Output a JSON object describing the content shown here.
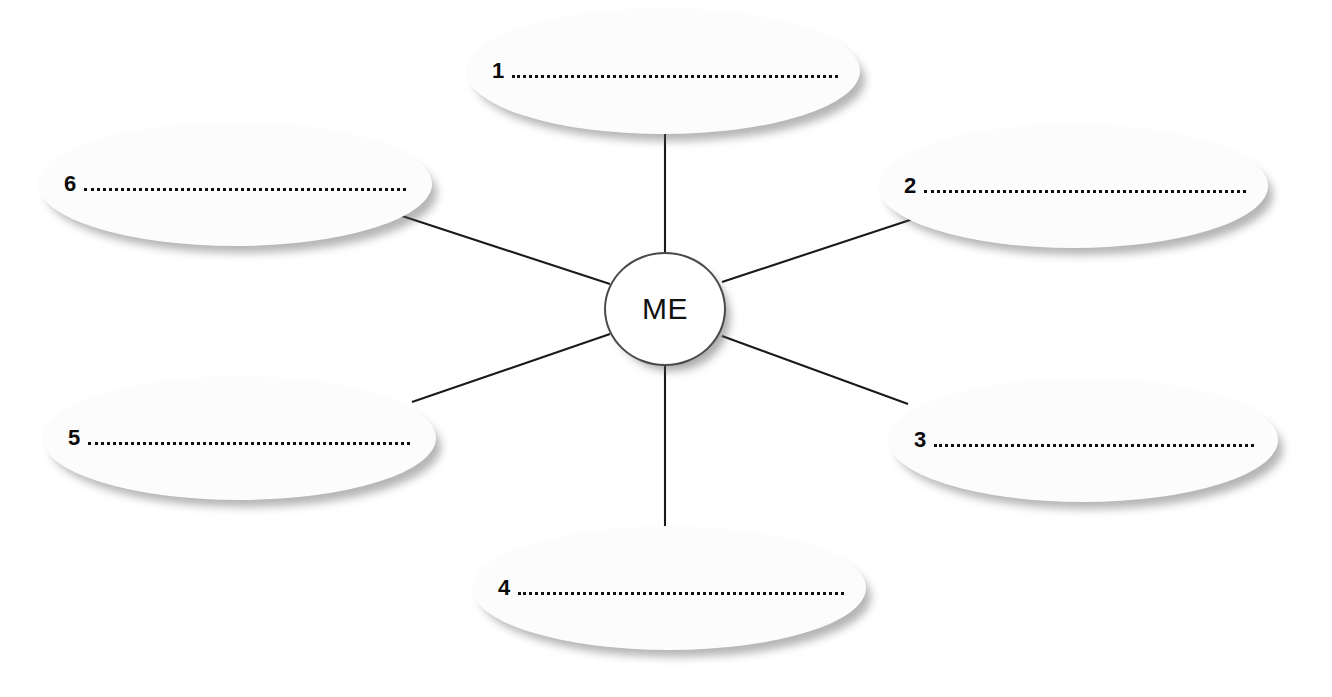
{
  "diagram": {
    "type": "mind-map",
    "title": "",
    "center": {
      "label": "ME",
      "shape": "circle",
      "cx": 665,
      "cy": 309,
      "rx": 61,
      "ry": 57
    },
    "line_color": "#1a1a1a",
    "node_fill": "#fcfcfc",
    "number_color": "#0a0a0a",
    "branch_count": 6,
    "branches": [
      {
        "number": "1",
        "position": "top",
        "shape": "ellipse",
        "left": 466,
        "top": 8,
        "width": 394,
        "height": 126,
        "text_offset_x": 24,
        "text_baseline_y": 68,
        "connector": {
          "x1": 665,
          "y1": 133,
          "x2": 665,
          "y2": 252
        }
      },
      {
        "number": "2",
        "position": "top-right",
        "shape": "ellipse",
        "left": 878,
        "top": 124,
        "width": 390,
        "height": 124,
        "text_offset_x": 24,
        "text_baseline_y": 184,
        "connector": {
          "x1": 916,
          "y1": 218,
          "x2": 722,
          "y2": 282
        }
      },
      {
        "number": "3",
        "position": "bottom-right",
        "shape": "ellipse",
        "left": 888,
        "top": 378,
        "width": 390,
        "height": 124,
        "text_offset_x": 24,
        "text_baseline_y": 434,
        "connector": {
          "x1": 722,
          "y1": 336,
          "x2": 908,
          "y2": 404
        }
      },
      {
        "number": "4",
        "position": "bottom",
        "shape": "ellipse",
        "left": 472,
        "top": 526,
        "width": 394,
        "height": 124,
        "text_offset_x": 24,
        "text_baseline_y": 578,
        "connector": {
          "x1": 665,
          "y1": 366,
          "x2": 665,
          "y2": 528
        }
      },
      {
        "number": "5",
        "position": "bottom-left",
        "shape": "ellipse",
        "left": 42,
        "top": 376,
        "width": 394,
        "height": 124,
        "text_offset_x": 24,
        "text_baseline_y": 432,
        "connector": {
          "x1": 412,
          "y1": 402,
          "x2": 610,
          "y2": 334
        }
      },
      {
        "number": "6",
        "position": "top-left",
        "shape": "ellipse",
        "left": 38,
        "top": 122,
        "width": 394,
        "height": 124,
        "text_offset_x": 24,
        "text_baseline_y": 180,
        "connector": {
          "x1": 396,
          "y1": 214,
          "x2": 610,
          "y2": 284
        }
      }
    ]
  }
}
